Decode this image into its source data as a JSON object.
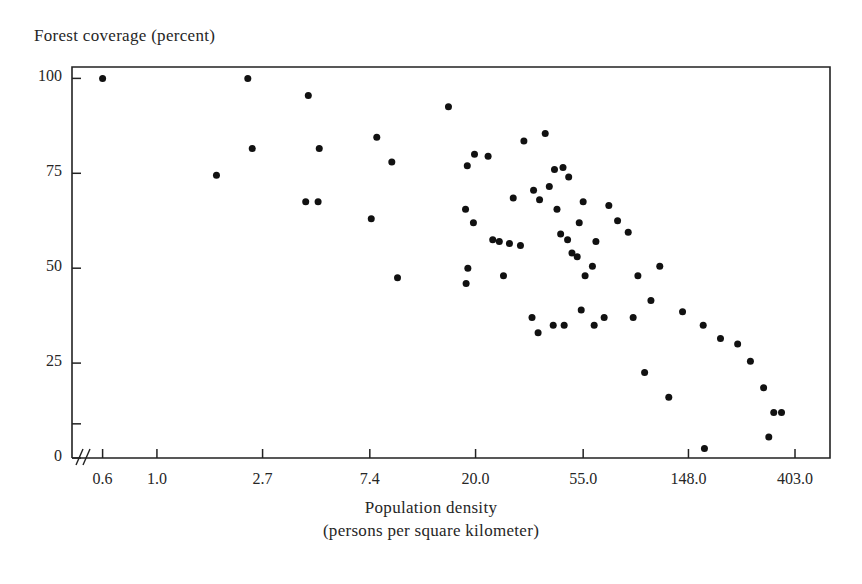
{
  "chart_data": {
    "type": "scatter",
    "title": "",
    "ylabel": "Forest coverage (percent)",
    "xlabel": "Population density",
    "xlabel_sub": "(persons per square kilometer)",
    "xscale": "log",
    "yscale": "linear",
    "grid": false,
    "legend": null,
    "xtick_labels": [
      "0.6",
      "1.0",
      "2.7",
      "7.4",
      "20.0",
      "55.0",
      "148.0",
      "403.0"
    ],
    "xtick_values": [
      0.6,
      1.0,
      2.7,
      7.4,
      20.0,
      55.0,
      148.0,
      403.0
    ],
    "ytick_labels": [
      "0",
      "25",
      "50",
      "75",
      "100"
    ],
    "ytick_values": [
      0,
      25,
      50,
      75,
      100
    ],
    "ylim": [
      0,
      103
    ],
    "xlim": [
      0.45,
      560
    ],
    "marker": "filled-circle",
    "marker_color": "#111111",
    "marker_size_px": 7,
    "n_points": 70,
    "points": [
      {
        "x": 0.6,
        "y": 100
      },
      {
        "x": 2.35,
        "y": 100
      },
      {
        "x": 4.15,
        "y": 95.5
      },
      {
        "x": 1.75,
        "y": 74.5
      },
      {
        "x": 2.45,
        "y": 81.5
      },
      {
        "x": 4.6,
        "y": 81.5
      },
      {
        "x": 7.9,
        "y": 84.5
      },
      {
        "x": 9.1,
        "y": 78
      },
      {
        "x": 4.05,
        "y": 67.5
      },
      {
        "x": 4.55,
        "y": 67.5
      },
      {
        "x": 7.5,
        "y": 63
      },
      {
        "x": 9.6,
        "y": 47.5
      },
      {
        "x": 15.5,
        "y": 92.5
      },
      {
        "x": 18.5,
        "y": 77
      },
      {
        "x": 19.8,
        "y": 80
      },
      {
        "x": 22.5,
        "y": 79.5
      },
      {
        "x": 18.2,
        "y": 65.5
      },
      {
        "x": 19.6,
        "y": 62
      },
      {
        "x": 25.0,
        "y": 57
      },
      {
        "x": 27.5,
        "y": 56.5
      },
      {
        "x": 18.6,
        "y": 50
      },
      {
        "x": 18.3,
        "y": 46
      },
      {
        "x": 26.0,
        "y": 48
      },
      {
        "x": 31.5,
        "y": 83.5
      },
      {
        "x": 38.5,
        "y": 85.5
      },
      {
        "x": 42.0,
        "y": 76
      },
      {
        "x": 45.5,
        "y": 76.5
      },
      {
        "x": 40.0,
        "y": 71.5
      },
      {
        "x": 34.5,
        "y": 70.5
      },
      {
        "x": 36.5,
        "y": 68
      },
      {
        "x": 48.0,
        "y": 74
      },
      {
        "x": 43.0,
        "y": 65.5
      },
      {
        "x": 55.0,
        "y": 67.5
      },
      {
        "x": 44.5,
        "y": 59
      },
      {
        "x": 47.5,
        "y": 57.5
      },
      {
        "x": 53.0,
        "y": 62
      },
      {
        "x": 49.5,
        "y": 54
      },
      {
        "x": 52.0,
        "y": 53
      },
      {
        "x": 62.0,
        "y": 57
      },
      {
        "x": 70.0,
        "y": 66.5
      },
      {
        "x": 76.0,
        "y": 62.5
      },
      {
        "x": 84.0,
        "y": 59.5
      },
      {
        "x": 60.0,
        "y": 50.5
      },
      {
        "x": 56.0,
        "y": 48
      },
      {
        "x": 34.0,
        "y": 37
      },
      {
        "x": 36.0,
        "y": 33
      },
      {
        "x": 41.5,
        "y": 35
      },
      {
        "x": 46.0,
        "y": 35
      },
      {
        "x": 54.0,
        "y": 39
      },
      {
        "x": 61.0,
        "y": 35
      },
      {
        "x": 67.0,
        "y": 37
      },
      {
        "x": 113.0,
        "y": 50.5
      },
      {
        "x": 104.0,
        "y": 41.5
      },
      {
        "x": 140.0,
        "y": 38.5
      },
      {
        "x": 170.0,
        "y": 35
      },
      {
        "x": 200.0,
        "y": 31.5
      },
      {
        "x": 235.0,
        "y": 30
      },
      {
        "x": 265.0,
        "y": 25.5
      },
      {
        "x": 300.0,
        "y": 18.5
      },
      {
        "x": 330.0,
        "y": 12
      },
      {
        "x": 355.0,
        "y": 12
      },
      {
        "x": 315.0,
        "y": 5.5
      },
      {
        "x": 98.0,
        "y": 22.5
      },
      {
        "x": 123.0,
        "y": 16
      },
      {
        "x": 172.0,
        "y": 2.5
      },
      {
        "x": 28.5,
        "y": 68.5
      },
      {
        "x": 30.5,
        "y": 56
      },
      {
        "x": 23.5,
        "y": 57.5
      },
      {
        "x": 88.0,
        "y": 37
      },
      {
        "x": 92.0,
        "y": 48
      }
    ]
  },
  "axes": {
    "frame_color": "#222222",
    "has_axis_break": true,
    "break_symbol": "//"
  }
}
